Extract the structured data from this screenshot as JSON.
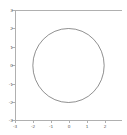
{
  "figure": {
    "background_color": "#ffffff",
    "spine_color": "#b0b0b0",
    "tick_label_color": "#555555"
  },
  "chart_data": {
    "type": "line",
    "title": "",
    "xlabel": "",
    "ylabel": "",
    "xlim": [
      -3,
      3
    ],
    "ylim": [
      -3,
      3
    ],
    "grid": false,
    "legend": null,
    "xticks": [
      -3,
      -2,
      -1,
      0,
      1,
      2
    ],
    "xtick_labels": [
      "-3",
      "-2",
      "-1",
      "0",
      "1",
      "2"
    ],
    "yticks": [
      3,
      2,
      1,
      0,
      -1,
      -2,
      -3
    ],
    "ytick_labels": [
      "3",
      "2",
      "1",
      "0",
      "-1",
      "-2",
      "-3"
    ],
    "series": [
      {
        "name": "circle",
        "shape": "circle",
        "center": [
          0,
          0
        ],
        "radius": 2,
        "color": "#444444",
        "linewidth": 0.6,
        "fill": "none"
      }
    ],
    "annotations": []
  }
}
